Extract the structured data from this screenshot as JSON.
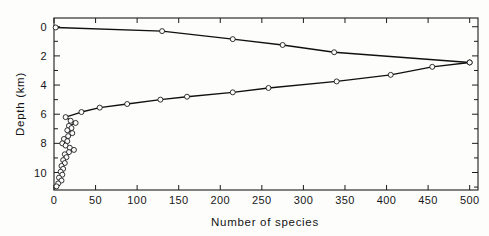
{
  "figure": {
    "background_color": "#fdfdfc",
    "line_color": "#101010",
    "marker_fill": "#fbfbfb"
  },
  "chart_data": {
    "type": "line",
    "title": "",
    "subtitle": "",
    "xlabel": "Number of species",
    "ylabel": "Depth (km)",
    "xlim": [
      0,
      510
    ],
    "ylim": [
      11.2,
      -0.6
    ],
    "y_inverted": true,
    "grid": false,
    "legend": "none",
    "x_ticks": [
      0,
      50,
      100,
      150,
      200,
      250,
      300,
      350,
      400,
      450,
      500
    ],
    "x_tick_labels": [
      "0",
      "50",
      "100",
      "150",
      "200",
      "250",
      "300",
      "350",
      "400",
      "450",
      "500"
    ],
    "y_ticks": [
      0,
      1,
      2,
      3,
      4,
      5,
      6,
      7,
      8,
      9,
      10,
      11
    ],
    "y_tick_labels": [
      "0",
      "",
      "2",
      "",
      "4",
      "",
      "6",
      "",
      "8",
      "",
      "10",
      ""
    ],
    "y_labeled_ticks": [
      0,
      2,
      4,
      6,
      8,
      10
    ],
    "series": [
      {
        "name": "upper-branch",
        "marker": "open-circle",
        "points": [
          {
            "x": 2,
            "y": 0.05
          },
          {
            "x": 130,
            "y": 0.3
          },
          {
            "x": 215,
            "y": 0.85
          },
          {
            "x": 275,
            "y": 1.25
          },
          {
            "x": 337,
            "y": 1.75
          },
          {
            "x": 500,
            "y": 2.45
          }
        ]
      },
      {
        "name": "lower-branch",
        "marker": "open-circle",
        "points": [
          {
            "x": 500,
            "y": 2.45
          },
          {
            "x": 455,
            "y": 2.75
          },
          {
            "x": 405,
            "y": 3.3
          },
          {
            "x": 340,
            "y": 3.75
          },
          {
            "x": 258,
            "y": 4.2
          },
          {
            "x": 215,
            "y": 4.5
          },
          {
            "x": 160,
            "y": 4.8
          },
          {
            "x": 128,
            "y": 5.0
          },
          {
            "x": 88,
            "y": 5.3
          },
          {
            "x": 55,
            "y": 5.55
          },
          {
            "x": 33,
            "y": 5.85
          },
          {
            "x": 14,
            "y": 6.2
          },
          {
            "x": 20,
            "y": 6.45
          },
          {
            "x": 26,
            "y": 6.6
          },
          {
            "x": 18,
            "y": 6.8
          },
          {
            "x": 21,
            "y": 6.95
          },
          {
            "x": 16,
            "y": 7.1
          },
          {
            "x": 22,
            "y": 7.3
          },
          {
            "x": 17,
            "y": 7.5
          },
          {
            "x": 12,
            "y": 7.7
          },
          {
            "x": 16,
            "y": 7.85
          },
          {
            "x": 10,
            "y": 8.0
          },
          {
            "x": 14,
            "y": 8.15
          },
          {
            "x": 19,
            "y": 8.3
          },
          {
            "x": 24,
            "y": 8.45
          },
          {
            "x": 18,
            "y": 8.6
          },
          {
            "x": 13,
            "y": 8.75
          },
          {
            "x": 15,
            "y": 8.95
          },
          {
            "x": 11,
            "y": 9.15
          },
          {
            "x": 13,
            "y": 9.35
          },
          {
            "x": 9,
            "y": 9.55
          },
          {
            "x": 11,
            "y": 9.75
          },
          {
            "x": 8,
            "y": 9.95
          },
          {
            "x": 10,
            "y": 10.15
          },
          {
            "x": 6,
            "y": 10.35
          },
          {
            "x": 9,
            "y": 10.55
          },
          {
            "x": 5,
            "y": 10.75
          },
          {
            "x": 3,
            "y": 10.95
          }
        ]
      }
    ]
  }
}
